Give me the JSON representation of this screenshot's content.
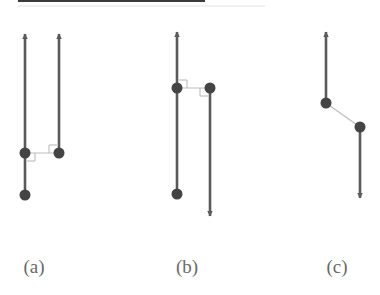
{
  "figure": {
    "top_rule": {
      "x1": 18,
      "x2": 205,
      "y": 1
    },
    "colors": {
      "line": "#5a5a5a",
      "node": "#444444",
      "connector": "#bdbdbd",
      "right_angle": "#b5b5b5",
      "label": "#6a6a6a",
      "rule": "#3a3a3a"
    },
    "panels": [
      {
        "id": "a",
        "label": "(a)",
        "label_pos": {
          "x": 34,
          "y": 256
        },
        "nodes": [
          {
            "x": 25,
            "y": 153
          },
          {
            "x": 25,
            "y": 195
          },
          {
            "x": 59,
            "y": 153
          }
        ],
        "vectors": [
          {
            "x1": 25,
            "y1": 195,
            "x2": 25,
            "y2": 34,
            "dir": "up"
          },
          {
            "x1": 59,
            "y1": 153,
            "x2": 59,
            "y2": 34,
            "dir": "up"
          }
        ],
        "connector": {
          "x1": 25,
          "y1": 153,
          "x2": 59,
          "y2": 153
        },
        "right_angles": [
          {
            "x": 25,
            "y": 153,
            "dx": 1,
            "dy": 1
          },
          {
            "x": 59,
            "y": 153,
            "dx": -1,
            "dy": -1
          }
        ]
      },
      {
        "id": "b",
        "label": "(b)",
        "label_pos": {
          "x": 187,
          "y": 256
        },
        "nodes": [
          {
            "x": 177,
            "y": 88
          },
          {
            "x": 177,
            "y": 194
          },
          {
            "x": 210,
            "y": 88
          }
        ],
        "vectors": [
          {
            "x1": 177,
            "y1": 194,
            "x2": 177,
            "y2": 32,
            "dir": "up"
          },
          {
            "x1": 210,
            "y1": 88,
            "x2": 210,
            "y2": 216,
            "dir": "down"
          }
        ],
        "connector": {
          "x1": 177,
          "y1": 88,
          "x2": 210,
          "y2": 88
        },
        "right_angles": [
          {
            "x": 177,
            "y": 88,
            "dx": 1,
            "dy": -1
          },
          {
            "x": 210,
            "y": 88,
            "dx": -1,
            "dy": 1
          }
        ]
      },
      {
        "id": "c",
        "label": "(c)",
        "label_pos": {
          "x": 337,
          "y": 256
        },
        "nodes": [
          {
            "x": 326,
            "y": 103
          },
          {
            "x": 360,
            "y": 127
          }
        ],
        "vectors": [
          {
            "x1": 326,
            "y1": 103,
            "x2": 326,
            "y2": 32,
            "dir": "up"
          },
          {
            "x1": 360,
            "y1": 127,
            "x2": 360,
            "y2": 198,
            "dir": "down"
          }
        ],
        "connector": {
          "x1": 326,
          "y1": 103,
          "x2": 360,
          "y2": 127
        },
        "right_angles": []
      }
    ]
  }
}
